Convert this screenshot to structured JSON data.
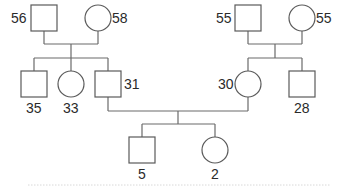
{
  "diagram": {
    "type": "pedigree",
    "generations": [
      {
        "id": "gen1",
        "members": [
          {
            "id": "p1",
            "sex": "male",
            "age": "56",
            "shape": "square"
          },
          {
            "id": "p2",
            "sex": "female",
            "age": "58",
            "shape": "circle"
          },
          {
            "id": "p3",
            "sex": "male",
            "age": "55",
            "shape": "square"
          },
          {
            "id": "p4",
            "sex": "female",
            "age": "55",
            "shape": "circle"
          }
        ]
      },
      {
        "id": "gen2",
        "members": [
          {
            "id": "p5",
            "sex": "male",
            "age": "35",
            "shape": "square",
            "parents": [
              "p1",
              "p2"
            ]
          },
          {
            "id": "p6",
            "sex": "female",
            "age": "33",
            "shape": "circle",
            "parents": [
              "p1",
              "p2"
            ]
          },
          {
            "id": "p7",
            "sex": "male",
            "age": "31",
            "shape": "square",
            "parents": [
              "p1",
              "p2"
            ]
          },
          {
            "id": "p8",
            "sex": "female",
            "age": "30",
            "shape": "circle",
            "parents": [
              "p3",
              "p4"
            ]
          },
          {
            "id": "p9",
            "sex": "male",
            "age": "28",
            "shape": "square",
            "parents": [
              "p3",
              "p4"
            ]
          }
        ]
      },
      {
        "id": "gen3",
        "members": [
          {
            "id": "p10",
            "sex": "male",
            "age": "5",
            "shape": "square",
            "parents": [
              "p7",
              "p8"
            ]
          },
          {
            "id": "p11",
            "sex": "female",
            "age": "2",
            "shape": "circle",
            "parents": [
              "p7",
              "p8"
            ]
          }
        ]
      }
    ],
    "couples": [
      [
        "p1",
        "p2"
      ],
      [
        "p3",
        "p4"
      ],
      [
        "p7",
        "p8"
      ]
    ]
  },
  "labels": {
    "p1": "56",
    "p2": "58",
    "p3": "55",
    "p4": "55",
    "p5": "35",
    "p6": "33",
    "p7": "31",
    "p8": "30",
    "p9": "28",
    "p10": "5",
    "p11": "2"
  },
  "colors": {
    "stroke": "#5a5a5a",
    "text": "#2a2a2a",
    "background": "#ffffff"
  }
}
